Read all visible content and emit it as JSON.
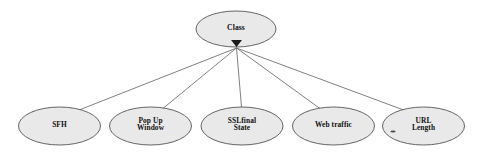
{
  "diagram": {
    "type": "naive-bayes-tree",
    "background_color": "#ffffff",
    "node_fill_color": "#e9e9e9",
    "node_stroke_color": "#555555",
    "edge_color": "#6a6a6a",
    "marker_color": "#1a1a1a",
    "text_color": "#111111",
    "root": {
      "id": "class",
      "label": "Class",
      "cx": 236,
      "cy": 29,
      "rx": 40,
      "ry": 18
    },
    "marker": {
      "name": "aggregation-marker",
      "x": 236.5,
      "y": 47,
      "width": 11,
      "height": 7
    },
    "leaves": [
      {
        "id": "sfh",
        "label": "SFH",
        "lines": [
          "SFH"
        ],
        "cx": 59.5,
        "cy": 126,
        "rx": 41,
        "ry": 19
      },
      {
        "id": "pop-up-window",
        "label": "Pop Up Window",
        "lines": [
          "Pop Up",
          "Window"
        ],
        "cx": 150.5,
        "cy": 126,
        "rx": 41,
        "ry": 19
      },
      {
        "id": "sslfinal-state",
        "label": "SSLfinal State",
        "lines": [
          "SSLfinal",
          "State"
        ],
        "cx": 242,
        "cy": 126,
        "rx": 41,
        "ry": 19
      },
      {
        "id": "web-traffic",
        "label": "Web traffic",
        "lines": [
          "Web traffic"
        ],
        "cx": 333.5,
        "cy": 126,
        "rx": 41,
        "ry": 19
      },
      {
        "id": "url-length",
        "label": "URL Length",
        "lines": [
          "URL",
          "Length"
        ],
        "cx": 423.5,
        "cy": 126,
        "rx": 41,
        "ry": 19
      }
    ],
    "edges": [
      {
        "id": "edge-class-sfh",
        "from": "class",
        "to": "sfh",
        "x1": 236.5,
        "y1": 48,
        "x2": 74,
        "y2": 112
      },
      {
        "id": "edge-class-pop-up-window",
        "from": "class",
        "to": "pop-up-window",
        "x1": 236.5,
        "y1": 48,
        "x2": 161,
        "y2": 110
      },
      {
        "id": "edge-class-sslfinal-state",
        "from": "class",
        "to": "sslfinal-state",
        "x1": 236.5,
        "y1": 48,
        "x2": 241.5,
        "y2": 107
      },
      {
        "id": "edge-class-web-traffic",
        "from": "class",
        "to": "web-traffic",
        "x1": 236.5,
        "y1": 48,
        "x2": 322,
        "y2": 110
      },
      {
        "id": "edge-class-url-length",
        "from": "class",
        "to": "url-length",
        "x1": 236.5,
        "y1": 48,
        "x2": 409,
        "y2": 112
      }
    ],
    "artifact_dot": {
      "name": "speck-artifact",
      "cx": 393,
      "cy": 131.5,
      "rx": 2.6,
      "ry": 0.9
    }
  }
}
